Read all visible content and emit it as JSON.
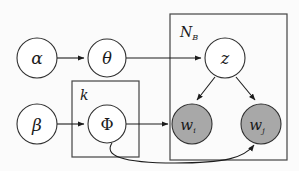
{
  "diagram": {
    "background_color": "#fbfbfb",
    "stroke_color": "#1c1c1c",
    "observed_fill": "#a8a8a8",
    "latent_fill": "#ffffff",
    "plates": [
      {
        "id": "plate-nb",
        "label": "N",
        "label_subscript": "B",
        "x": 170,
        "y": 14,
        "width": 117,
        "height": 146
      },
      {
        "id": "plate-k",
        "label": "k",
        "label_subscript": "",
        "x": 72,
        "y": 81,
        "width": 67,
        "height": 76
      }
    ],
    "nodes": [
      {
        "id": "alpha",
        "label": "α",
        "subscript": "",
        "cx": 37,
        "cy": 58,
        "r": 20,
        "observed": false
      },
      {
        "id": "theta",
        "label": "θ",
        "subscript": "",
        "cx": 107,
        "cy": 58,
        "r": 19,
        "observed": false
      },
      {
        "id": "z",
        "label": "z",
        "subscript": "",
        "cx": 225,
        "cy": 58,
        "r": 20,
        "observed": false
      },
      {
        "id": "beta",
        "label": "β",
        "subscript": "",
        "cx": 37,
        "cy": 124,
        "r": 20,
        "observed": false
      },
      {
        "id": "phi",
        "label": "Φ",
        "subscript": "",
        "cx": 107,
        "cy": 124,
        "r": 19,
        "observed": false
      },
      {
        "id": "w_i",
        "label": "w",
        "subscript": "i",
        "cx": 192,
        "cy": 124,
        "r": 20,
        "observed": true
      },
      {
        "id": "w_j",
        "label": "w",
        "subscript": "j",
        "cx": 261,
        "cy": 124,
        "r": 20,
        "observed": true
      }
    ],
    "edges": [
      {
        "id": "alpha-to-theta",
        "from": "alpha",
        "to": "theta",
        "kind": "straight"
      },
      {
        "id": "theta-to-z",
        "from": "theta",
        "to": "z",
        "kind": "straight"
      },
      {
        "id": "beta-to-phi",
        "from": "beta",
        "to": "phi",
        "kind": "straight"
      },
      {
        "id": "phi-to-wi",
        "from": "phi",
        "to": "w_i",
        "kind": "straight"
      },
      {
        "id": "z-to-wi",
        "from": "z",
        "to": "w_i",
        "kind": "diagonal"
      },
      {
        "id": "z-to-wj",
        "from": "z",
        "to": "w_j",
        "kind": "diagonal"
      },
      {
        "id": "phi-to-wj",
        "from": "phi",
        "to": "w_j",
        "kind": "curved"
      }
    ]
  }
}
